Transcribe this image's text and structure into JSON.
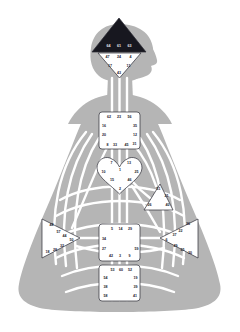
{
  "palette": {
    "body_fill": "#b5b5b5",
    "channel_line": "#ffffff",
    "center_open_fill": "#ffffff",
    "center_defined_fill": "#17171f",
    "center_stroke": "#2b2b35",
    "gate_text": "#1a1a2e",
    "gate_text_on_dark": "#e8e8ee",
    "background": "#ffffff"
  },
  "figure": {
    "pose": "seated-meditation-silhouette",
    "head_profile_facing": "right"
  },
  "centers": [
    {
      "key": "head",
      "name": "Head Center",
      "shape": "triangle-up",
      "state": "defined",
      "gates": [
        {
          "num": "64",
          "x": 108.5,
          "y": 46.5
        },
        {
          "num": "61",
          "x": 119.0,
          "y": 46.5
        },
        {
          "num": "63",
          "x": 129.5,
          "y": 46.5
        }
      ]
    },
    {
      "key": "ajna",
      "name": "Ajna Center",
      "shape": "triangle-down",
      "state": "open",
      "gates": [
        {
          "num": "47",
          "x": 107.5,
          "y": 57.5
        },
        {
          "num": "24",
          "x": 119.0,
          "y": 57.5
        },
        {
          "num": "4",
          "x": 130.5,
          "y": 57.5
        },
        {
          "num": "17",
          "x": 110.0,
          "y": 66.0
        },
        {
          "num": "11",
          "x": 128.5,
          "y": 66.0
        },
        {
          "num": "43",
          "x": 119.0,
          "y": 73.5
        }
      ]
    },
    {
      "key": "throat",
      "name": "Throat Center",
      "shape": "square",
      "state": "open",
      "gates": [
        {
          "num": "62",
          "x": 109.0,
          "y": 117.0
        },
        {
          "num": "23",
          "x": 119.0,
          "y": 117.0
        },
        {
          "num": "56",
          "x": 129.5,
          "y": 117.0
        },
        {
          "num": "16",
          "x": 104.0,
          "y": 126.5
        },
        {
          "num": "35",
          "x": 135.0,
          "y": 126.5
        },
        {
          "num": "20",
          "x": 104.0,
          "y": 135.5
        },
        {
          "num": "12",
          "x": 135.0,
          "y": 135.5
        },
        {
          "num": "31",
          "x": 134.5,
          "y": 144.0
        },
        {
          "num": "8",
          "x": 107.5,
          "y": 145.0
        },
        {
          "num": "33",
          "x": 115.0,
          "y": 145.0
        },
        {
          "num": "45",
          "x": 126.5,
          "y": 145.0
        }
      ]
    },
    {
      "key": "g",
      "name": "G Center",
      "shape": "diamond-heart",
      "state": "open",
      "gates": [
        {
          "num": "7",
          "x": 111.5,
          "y": 163.5
        },
        {
          "num": "13",
          "x": 129.0,
          "y": 163.5
        },
        {
          "num": "1",
          "x": 120.0,
          "y": 170.5
        },
        {
          "num": "10",
          "x": 103.5,
          "y": 172.5
        },
        {
          "num": "25",
          "x": 136.5,
          "y": 172.5
        },
        {
          "num": "15",
          "x": 112.0,
          "y": 180.5
        },
        {
          "num": "46",
          "x": 129.5,
          "y": 180.5
        },
        {
          "num": "2",
          "x": 120.0,
          "y": 189.0
        }
      ]
    },
    {
      "key": "ego",
      "name": "Ego / Heart Center",
      "shape": "triangle-right",
      "state": "open",
      "gates": [
        {
          "num": "51",
          "x": 158.5,
          "y": 189.5
        },
        {
          "num": "21",
          "x": 166.5,
          "y": 196.0
        },
        {
          "num": "26",
          "x": 149.5,
          "y": 205.0
        },
        {
          "num": "40",
          "x": 167.5,
          "y": 205.5
        }
      ]
    },
    {
      "key": "spleen",
      "name": "Spleen Center",
      "shape": "triangle-left",
      "state": "open",
      "gates": [
        {
          "num": "48",
          "x": 51.5,
          "y": 225.5
        },
        {
          "num": "57",
          "x": 58.5,
          "y": 232.5
        },
        {
          "num": "44",
          "x": 64.5,
          "y": 236.5
        },
        {
          "num": "50",
          "x": 71.5,
          "y": 240.5
        },
        {
          "num": "32",
          "x": 62.0,
          "y": 246.0
        },
        {
          "num": "28",
          "x": 55.0,
          "y": 250.0
        },
        {
          "num": "18",
          "x": 47.5,
          "y": 252.5
        }
      ]
    },
    {
      "key": "solar_plexus",
      "name": "Solar Plexus Center",
      "shape": "triangle-right",
      "state": "open",
      "gates": [
        {
          "num": "36",
          "x": 188.0,
          "y": 224.5
        },
        {
          "num": "22",
          "x": 180.5,
          "y": 231.0
        },
        {
          "num": "37",
          "x": 174.5,
          "y": 235.5
        },
        {
          "num": "6",
          "x": 166.5,
          "y": 240.5
        },
        {
          "num": "49",
          "x": 175.5,
          "y": 246.0
        },
        {
          "num": "55",
          "x": 182.5,
          "y": 250.5
        },
        {
          "num": "30",
          "x": 190.0,
          "y": 253.0
        }
      ]
    },
    {
      "key": "sacral",
      "name": "Sacral Center",
      "shape": "square",
      "state": "open",
      "gates": [
        {
          "num": "5",
          "x": 112.0,
          "y": 229.0
        },
        {
          "num": "14",
          "x": 120.5,
          "y": 229.0
        },
        {
          "num": "29",
          "x": 130.0,
          "y": 229.0
        },
        {
          "num": "34",
          "x": 104.0,
          "y": 239.0
        },
        {
          "num": "27",
          "x": 104.0,
          "y": 249.5
        },
        {
          "num": "59",
          "x": 136.5,
          "y": 249.5
        },
        {
          "num": "42",
          "x": 111.0,
          "y": 256.5
        },
        {
          "num": "3",
          "x": 120.0,
          "y": 256.5
        },
        {
          "num": "9",
          "x": 129.5,
          "y": 256.5
        }
      ]
    },
    {
      "key": "root",
      "name": "Root Center",
      "shape": "square",
      "state": "open",
      "gates": [
        {
          "num": "53",
          "x": 112.5,
          "y": 270.0
        },
        {
          "num": "60",
          "x": 121.0,
          "y": 270.0
        },
        {
          "num": "52",
          "x": 130.0,
          "y": 270.0
        },
        {
          "num": "54",
          "x": 105.5,
          "y": 278.0
        },
        {
          "num": "19",
          "x": 135.5,
          "y": 278.0
        },
        {
          "num": "38",
          "x": 105.5,
          "y": 287.0
        },
        {
          "num": "39",
          "x": 135.5,
          "y": 287.0
        },
        {
          "num": "58",
          "x": 105.5,
          "y": 296.0
        },
        {
          "num": "41",
          "x": 135.0,
          "y": 296.0
        }
      ]
    }
  ]
}
